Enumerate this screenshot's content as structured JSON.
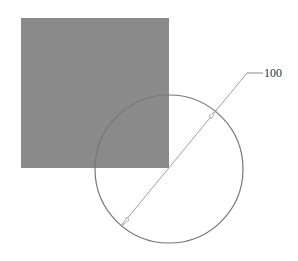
{
  "diagram": {
    "square": {
      "x": 21,
      "y": 18,
      "width": 148,
      "height": 150,
      "fill": "#8a8a8a"
    },
    "circle": {
      "cx": 169,
      "cy": 169,
      "r": 74,
      "stroke": "#777777"
    },
    "diameter_line": {
      "x1": 121,
      "y1": 226,
      "x2": 247,
      "y2": 73,
      "stroke": "#999999"
    },
    "leader": {
      "x1": 247,
      "y1": 73,
      "x2": 263,
      "y2": 73
    },
    "callout_label": "100",
    "colors": {
      "background": "#ffffff",
      "square_fill": "#8a8a8a",
      "line": "#999999"
    }
  }
}
